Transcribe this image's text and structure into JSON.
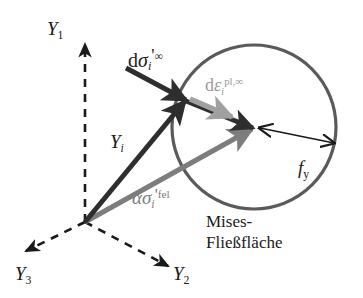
{
  "figure": {
    "kind": "vector-diagram",
    "background_color": "#ffffff"
  },
  "axes": {
    "origin_label": "",
    "items": [
      {
        "id": "y1",
        "name": "Y",
        "index": "1",
        "direction": "up"
      },
      {
        "id": "y2",
        "name": "Y",
        "index": "2",
        "direction": "down-right"
      },
      {
        "id": "y3",
        "name": "Y",
        "index": "3",
        "direction": "down-left"
      }
    ],
    "line_style": "dashed",
    "color": "#1a1a1a"
  },
  "yield_surface": {
    "shape": "circle",
    "caption_line1": "Mises-",
    "caption_line2": "Fließfläche",
    "stroke_color": "#5a5a5a",
    "center_x": 254,
    "center_y": 127,
    "radius": 82
  },
  "vectors": [
    {
      "id": "dsigma",
      "label_base": "d",
      "symbol": "σ",
      "subscript": "i",
      "prime": "'",
      "superscript": "∞",
      "color": "#2e2e2e",
      "style": "solid-thick",
      "arrowhead": "filled"
    },
    {
      "id": "depsilon",
      "label_base": "d",
      "symbol": "ε",
      "subscript": "i",
      "superscript": "pl,∞",
      "color": "#a0a0a0",
      "style": "solid-thick",
      "arrowhead": "filled"
    },
    {
      "id": "yi",
      "label_base": "",
      "symbol": "Y",
      "subscript": "i",
      "color": "#2e2e2e",
      "style": "solid-thick",
      "arrowhead": "filled"
    },
    {
      "id": "alpha-sigma",
      "label_base": "α",
      "symbol": "σ",
      "symbol_overbar": true,
      "subscript": "i",
      "prime": "'",
      "superscript": "fel",
      "color": "#7d7d7d",
      "style": "solid-thick",
      "arrowhead": "filled"
    },
    {
      "id": "fy",
      "label_base": "",
      "symbol": "f",
      "subscript": "y",
      "color": "#1a1a1a",
      "style": "solid-thin",
      "arrowhead": "double"
    }
  ],
  "labels": {
    "y1": {
      "base": "Y",
      "sub": "1"
    },
    "y2": {
      "base": "Y",
      "sub": "2"
    },
    "y3": {
      "base": "Y",
      "sub": "3"
    },
    "dsigma": {
      "d": "d",
      "sym": "σ",
      "sub": "i",
      "prime": "'",
      "sup": "∞"
    },
    "depsilon": {
      "d": "d",
      "sym": "ε",
      "sub": "i",
      "sup": "pl,∞"
    },
    "yi": {
      "sym": "Y",
      "sub": "i"
    },
    "asigma": {
      "alpha": "α",
      "sym": "σ",
      "sub": "i",
      "prime": "'",
      "sup": "fel"
    },
    "fy": {
      "sym": "f",
      "sub": "y"
    },
    "surface_line1": "Mises-",
    "surface_line2": "Fließfläche"
  },
  "colors": {
    "dark": "#2e2e2e",
    "mid_gray": "#7d7d7d",
    "light_gray": "#a0a0a0",
    "circle": "#5a5a5a",
    "axis": "#1a1a1a",
    "background": "#ffffff"
  }
}
